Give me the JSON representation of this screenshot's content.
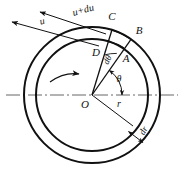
{
  "figure": {
    "type": "annulus-sector-diagram",
    "background_color": "#ffffff",
    "stroke_color": "#111111",
    "geometry": {
      "center_x": 92,
      "center_y": 95,
      "outer_radius": 68,
      "inner_radius": 56,
      "sector_angle_a_deg": 55,
      "sector_angle_c_deg": 73
    },
    "points": {
      "center": "O",
      "inner_right": "A",
      "outer_right": "B",
      "outer_left": "C",
      "inner_left": "D"
    },
    "labels": {
      "velocity_inner": "u",
      "velocity_outer": "u+du",
      "angle_theta": "θ",
      "angle_dtheta": "dθ",
      "radius": "r",
      "radius_increment": "dr"
    },
    "centerline_style": "dash-dot",
    "rotation_arrow": "counterclockwise"
  }
}
